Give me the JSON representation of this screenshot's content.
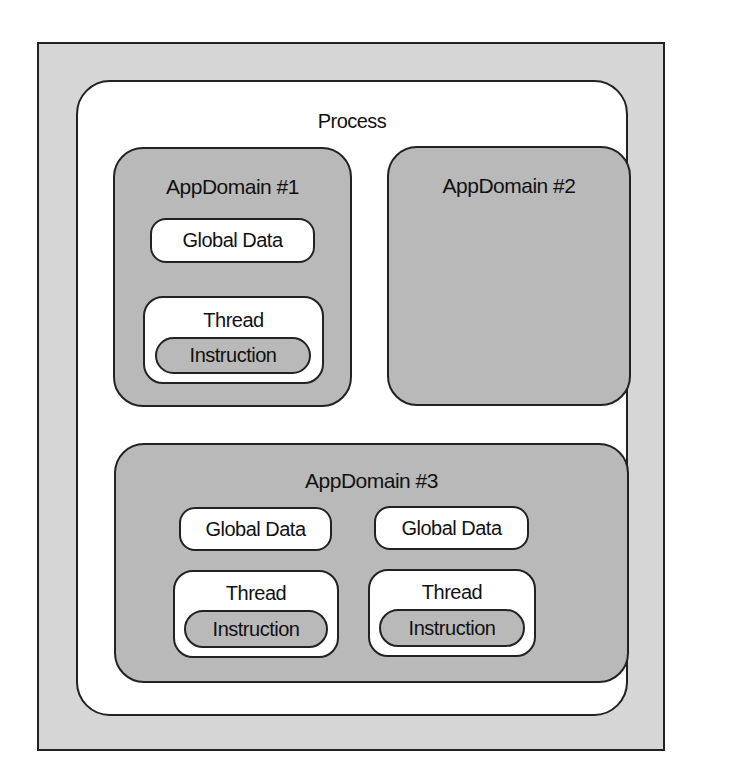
{
  "diagram": {
    "process": {
      "label": "Process"
    },
    "app_domains": [
      {
        "label": "AppDomain #1",
        "global_data": [
          "Global Data"
        ],
        "threads": [
          {
            "label": "Thread",
            "instruction": "Instruction"
          }
        ]
      },
      {
        "label": "AppDomain #2",
        "global_data": [],
        "threads": []
      },
      {
        "label": "AppDomain #3",
        "global_data": [
          "Global Data",
          "Global Data"
        ],
        "threads": [
          {
            "label": "Thread",
            "instruction": "Instruction"
          },
          {
            "label": "Thread",
            "instruction": "Instruction"
          }
        ]
      }
    ]
  },
  "colors": {
    "frame": "#d6d6d6",
    "process": "#ffffff",
    "app_domain": "#b9b9b9",
    "outline": "#222222"
  }
}
